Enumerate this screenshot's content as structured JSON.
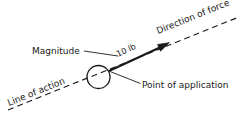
{
  "figure": {
    "background_color": "#ffffff",
    "stroke_color": "#1a1a1a",
    "text_color": "#1a1a1a",
    "width": 245,
    "height": 123
  },
  "labels": {
    "magnitude": "Magnitude",
    "force_value": "10 lb",
    "direction_of_force": "Direction of force",
    "line_of_action": "Line of action",
    "point_of_application": "Point of application"
  },
  "elements": {
    "line_of_action": {
      "name": "line-of-action-dashed-line",
      "style": "dashed",
      "x1": 8,
      "y1": 110,
      "x2": 239,
      "y2": 17,
      "angle_deg": -21.9
    },
    "force_vector": {
      "name": "force-vector-arrow",
      "style": "solid",
      "x1": 109,
      "y1": 71,
      "x2": 169,
      "y2": 43,
      "angle_deg": -25.0,
      "arrowhead": "filled-triangle"
    },
    "application_circle": {
      "name": "point-of-application-circle",
      "cx": 98.5,
      "cy": 77,
      "r": 11.5
    },
    "magnitude_leader": {
      "name": "magnitude-leader-line",
      "x1": 84,
      "y1": 51,
      "x2": 118,
      "y2": 56
    },
    "application_leader": {
      "name": "point-of-application-leader-line",
      "x1": 110,
      "y1": 71,
      "x2": 140,
      "y2": 83
    }
  },
  "label_placement": {
    "magnitude": {
      "x": 32,
      "y": 54,
      "rotate": 0
    },
    "force_value": {
      "x": 117,
      "y": 57,
      "rotate": -25
    },
    "direction_of_force": {
      "x": 160,
      "y": 33,
      "rotate": -22
    },
    "line_of_action": {
      "x": 9,
      "y": 106,
      "rotate": -22
    },
    "point_of_application": {
      "x": 142,
      "y": 88,
      "rotate": 0
    }
  }
}
